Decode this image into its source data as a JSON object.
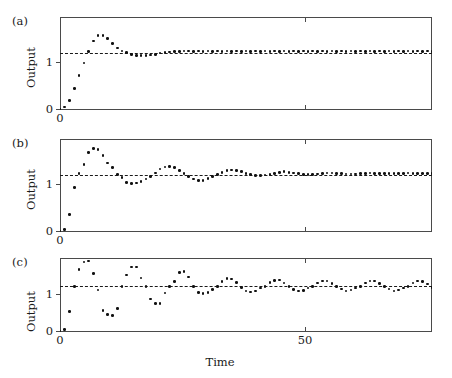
{
  "figure": {
    "xlabel": "Time",
    "panels": [
      {
        "tag": "(a)",
        "ylabel": "Output",
        "ytick_labels": [
          "0",
          "1"
        ],
        "xtick_labels": [
          "0",
          "50"
        ]
      },
      {
        "tag": "(b)",
        "ylabel": "Output",
        "ytick_labels": [
          "0",
          "1"
        ],
        "xtick_labels": [
          "0",
          "50"
        ]
      },
      {
        "tag": "(c)",
        "ylabel": "Output",
        "ytick_labels": [
          "0",
          "1"
        ],
        "xtick_labels": [
          "0",
          "50"
        ]
      }
    ]
  },
  "chart_data": [
    {
      "type": "scatter",
      "title": "(a)",
      "xlabel": "",
      "ylabel": "Output",
      "xlim": [
        0,
        78
      ],
      "ylim": [
        0,
        1.62
      ],
      "xticks": [
        0,
        50
      ],
      "yticks": [
        0,
        1
      ],
      "grid": false,
      "legend": "none",
      "annotations": [
        {
          "type": "hline",
          "y": 1,
          "style": "dashed",
          "label": "setpoint = 1"
        }
      ],
      "description": "Well-damped closed-loop step response; small overshoot near t=7, settles at 1 by t~22.",
      "x": [
        0,
        1,
        2,
        3,
        4,
        5,
        6,
        7,
        8,
        9,
        10,
        11,
        12,
        13,
        14,
        15,
        16,
        17,
        18,
        19,
        20,
        21,
        22,
        23,
        24,
        25,
        26,
        27,
        28,
        29,
        30,
        31,
        32,
        33,
        34,
        35,
        36,
        37,
        38,
        39,
        40,
        41,
        42,
        43,
        44,
        45,
        46,
        47,
        48,
        49,
        50,
        51,
        52,
        53,
        54,
        55,
        56,
        57,
        58,
        59,
        60,
        61,
        62,
        63,
        64,
        65,
        66,
        67,
        68,
        69,
        70,
        71,
        72,
        73,
        74,
        75,
        76,
        77,
        78
      ],
      "y": [
        0.02,
        0.05,
        0.17,
        0.37,
        0.6,
        0.82,
        1.02,
        1.2,
        1.3,
        1.3,
        1.25,
        1.16,
        1.08,
        1.03,
        1.0,
        0.97,
        0.95,
        0.95,
        0.95,
        0.96,
        0.97,
        0.99,
        1.0,
        1.01,
        1.02,
        1.02,
        1.03,
        1.03,
        1.02,
        1.03,
        1.02,
        1.03,
        1.02,
        1.03,
        1.02,
        1.03,
        1.02,
        1.03,
        1.02,
        1.03,
        1.02,
        1.03,
        1.02,
        1.03,
        1.02,
        1.03,
        1.02,
        1.03,
        1.02,
        1.03,
        1.02,
        1.03,
        1.02,
        1.03,
        1.02,
        1.03,
        1.02,
        1.03,
        1.02,
        1.03,
        1.02,
        1.03,
        1.02,
        1.03,
        1.02,
        1.03,
        1.02,
        1.03,
        1.02,
        1.03,
        1.02,
        1.03,
        1.02,
        1.03,
        1.02,
        1.03,
        1.02,
        1.03,
        1.02
      ]
    },
    {
      "type": "scatter",
      "title": "(b)",
      "xlabel": "",
      "ylabel": "Output",
      "xlim": [
        0,
        78
      ],
      "ylim": [
        0,
        1.62
      ],
      "xticks": [
        0,
        50
      ],
      "yticks": [
        0,
        1
      ],
      "grid": false,
      "legend": "none",
      "annotations": [
        {
          "type": "hline",
          "y": 1,
          "style": "dashed",
          "label": "setpoint = 1"
        }
      ],
      "description": "Under-damped response: overshoot to ~1.45 near t=7, decaying oscillations with period ~12, settles near 1 after t~45.",
      "x": [
        0,
        1,
        2,
        3,
        4,
        5,
        6,
        7,
        8,
        9,
        10,
        11,
        12,
        13,
        14,
        15,
        16,
        17,
        18,
        19,
        20,
        21,
        22,
        23,
        24,
        25,
        26,
        27,
        28,
        29,
        30,
        31,
        32,
        33,
        34,
        35,
        36,
        37,
        38,
        39,
        40,
        41,
        42,
        43,
        44,
        45,
        46,
        47,
        48,
        49,
        50,
        51,
        52,
        53,
        54,
        55,
        56,
        57,
        58,
        59,
        60,
        61,
        62,
        63,
        64,
        65,
        66,
        67,
        68,
        69,
        70,
        71,
        72,
        73,
        74,
        75,
        76,
        77,
        78
      ],
      "y": [
        0.02,
        0.04,
        0.3,
        0.78,
        1.02,
        1.18,
        1.38,
        1.45,
        1.44,
        1.33,
        1.2,
        1.12,
        1.0,
        0.95,
        0.86,
        0.84,
        0.85,
        0.88,
        0.92,
        0.97,
        1.03,
        1.1,
        1.13,
        1.14,
        1.12,
        1.07,
        1.02,
        0.97,
        0.92,
        0.9,
        0.9,
        0.93,
        0.97,
        1.0,
        1.04,
        1.07,
        1.08,
        1.07,
        1.05,
        1.02,
        1.0,
        0.98,
        0.98,
        0.99,
        1.0,
        1.02,
        1.04,
        1.05,
        1.04,
        1.03,
        1.02,
        1.0,
        1.0,
        1.0,
        1.01,
        1.02,
        1.03,
        1.03,
        1.02,
        1.02,
        1.01,
        1.01,
        1.01,
        1.02,
        1.02,
        1.03,
        1.02,
        1.02,
        1.02,
        1.02,
        1.02,
        1.02,
        1.02,
        1.03,
        1.02,
        1.02,
        1.02,
        1.02,
        1.02
      ]
    },
    {
      "type": "scatter",
      "title": "(c)",
      "xlabel": "Time",
      "ylabel": "Output",
      "xlim": [
        0,
        78
      ],
      "ylim": [
        0,
        1.62
      ],
      "xticks": [
        0,
        50
      ],
      "yticks": [
        0,
        1
      ],
      "grid": false,
      "legend": "none",
      "annotations": [
        {
          "type": "hline",
          "y": 1,
          "style": "dashed",
          "label": "setpoint = 1"
        }
      ],
      "description": "Marginally stable / oscillatory response: large swings from ~0.35 to ~1.55 early, settling into sustained oscillation of amplitude ~0.15 about 1 with period ~8.",
      "x": [
        0,
        1,
        2,
        3,
        4,
        5,
        6,
        7,
        8,
        9,
        10,
        11,
        12,
        13,
        14,
        15,
        16,
        17,
        18,
        19,
        20,
        21,
        22,
        23,
        24,
        25,
        26,
        27,
        28,
        29,
        30,
        31,
        32,
        33,
        34,
        35,
        36,
        37,
        38,
        39,
        40,
        41,
        42,
        43,
        44,
        45,
        46,
        47,
        48,
        49,
        50,
        51,
        52,
        53,
        54,
        55,
        56,
        57,
        58,
        59,
        60,
        61,
        62,
        63,
        64,
        65,
        66,
        67,
        68,
        69,
        70,
        71,
        72,
        73,
        74,
        75,
        76,
        77,
        78
      ],
      "y": [
        0.02,
        0.05,
        0.45,
        1.0,
        1.37,
        1.53,
        1.55,
        1.28,
        0.92,
        0.47,
        0.38,
        0.36,
        0.52,
        1.0,
        1.25,
        1.42,
        1.42,
        1.18,
        0.99,
        0.72,
        0.63,
        0.62,
        0.85,
        1.0,
        1.11,
        1.3,
        1.33,
        1.2,
        1.0,
        0.87,
        0.84,
        0.87,
        0.93,
        1.0,
        1.11,
        1.17,
        1.16,
        1.08,
        0.98,
        0.9,
        0.88,
        0.9,
        0.96,
        1.0,
        1.08,
        1.13,
        1.14,
        1.07,
        1.0,
        0.93,
        0.9,
        0.91,
        0.96,
        1.0,
        1.07,
        1.12,
        1.12,
        1.06,
        1.0,
        0.94,
        0.9,
        0.92,
        0.96,
        1.0,
        1.07,
        1.12,
        1.12,
        1.06,
        1.0,
        0.94,
        0.9,
        0.92,
        0.96,
        1.0,
        1.07,
        1.12,
        1.11,
        1.05,
        0.98
      ]
    }
  ]
}
